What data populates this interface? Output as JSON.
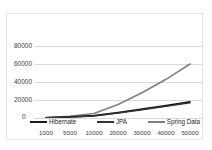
{
  "chart_data": {
    "type": "line",
    "title": "",
    "xlabel": "",
    "ylabel": "",
    "categories": [
      "1000",
      "5000",
      "10000",
      "20000",
      "30000",
      "40000",
      "50000"
    ],
    "yticks": [
      "0",
      "20000",
      "40000",
      "60000",
      "80000"
    ],
    "ylim": [
      0,
      80000
    ],
    "grid": true,
    "legend_position": "bottom",
    "series": [
      {
        "name": "Hibernate",
        "color": "#1a1a1a",
        "values": [
          300,
          1200,
          2600,
          6000,
          9800,
          13800,
          18000
        ]
      },
      {
        "name": "JPA",
        "color": "#333333",
        "values": [
          250,
          1000,
          2300,
          5400,
          9000,
          12900,
          16800
        ]
      },
      {
        "name": "Spring Data",
        "color": "#808080",
        "values": [
          400,
          2000,
          5000,
          15000,
          28000,
          43000,
          60000
        ]
      }
    ]
  },
  "legend": {
    "items": [
      {
        "label": "Hibernate",
        "color": "#1a1a1a"
      },
      {
        "label": "JPA",
        "color": "#333333"
      },
      {
        "label": "Spring Data",
        "color": "#808080"
      }
    ]
  },
  "axis": {
    "zero_label": "0"
  }
}
